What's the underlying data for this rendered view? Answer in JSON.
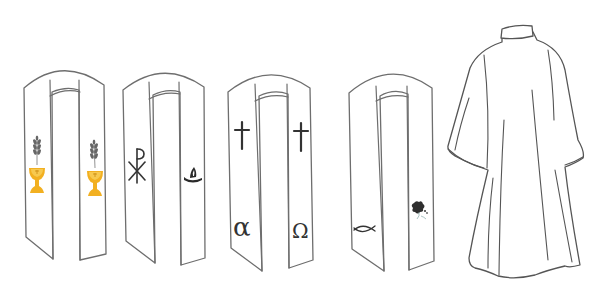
{
  "illustration": {
    "subject": "Liturgical vestments: four stoles and an alb",
    "colors": {
      "background": "#ffffff",
      "outline": "#6e6e6e",
      "symbol_dark": "#333333",
      "chalice_gold": "#f2b021",
      "chalice_gold_light": "#f7c94f",
      "wheat_gray": "#666666"
    },
    "stoles": [
      {
        "name": "stole-eucharist",
        "left_symbols": [
          "wheat-icon",
          "chalice-icon"
        ],
        "right_symbols": [
          "wheat-icon",
          "chalice-icon"
        ]
      },
      {
        "name": "stole-chi-rho",
        "left_symbols": [
          "chi-rho-icon"
        ],
        "right_symbols": [
          "oil-lamp-icon"
        ],
        "left_glyph": "☧"
      },
      {
        "name": "stole-alpha-omega",
        "left_symbols": [
          "cross-icon",
          "alpha-icon"
        ],
        "right_symbols": [
          "cross-icon",
          "omega-icon"
        ],
        "alpha": "α",
        "omega": "Ω"
      },
      {
        "name": "stole-ichthys",
        "left_symbols": [
          "fish-icon"
        ],
        "right_symbols": [
          "grape-vine-icon"
        ]
      }
    ],
    "garment": {
      "name": "alb",
      "description": "Full-length white alb with stand collar and wide sleeves"
    }
  }
}
